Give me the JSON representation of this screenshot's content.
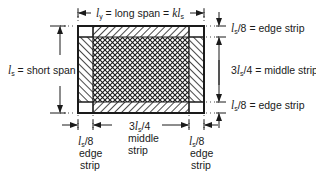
{
  "diagram": {
    "colors": {
      "ink": "#1a1a1a",
      "background": "#ffffff"
    },
    "long_span": {
      "symbol": "l",
      "subscript": "y",
      "text": " = long span = ",
      "k": "k",
      "ls_sym": "l",
      "ls_sub": "s"
    },
    "short_span": {
      "symbol": "l",
      "subscript": "s",
      "text": " = short span"
    },
    "right_labels": [
      {
        "prefix": "",
        "symbol": "l",
        "subscript": "s",
        "suffix": "/8 = edge strip"
      },
      {
        "prefix": "3",
        "symbol": "l",
        "subscript": "s",
        "suffix": "/4 = middle strip"
      },
      {
        "prefix": "",
        "symbol": "l",
        "subscript": "s",
        "suffix": "/8 = edge strip"
      }
    ],
    "bottom_labels": [
      {
        "prefix": "",
        "symbol": "l",
        "subscript": "s",
        "suffix": "/8",
        "line2": "edge",
        "line3": "strip"
      },
      {
        "prefix": "3",
        "symbol": "l",
        "subscript": "s",
        "suffix": "/4",
        "line2": "middle",
        "line3": "strip"
      },
      {
        "prefix": "",
        "symbol": "l",
        "subscript": "s",
        "suffix": "/8",
        "line2": "edge",
        "line3": "strip"
      }
    ]
  }
}
